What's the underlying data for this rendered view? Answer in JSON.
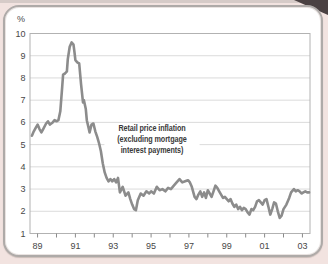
{
  "page": {
    "background_color": "#f2e3e0",
    "card_color": "#ffffff",
    "card_border_color": "#aeaaa8",
    "corner_accent_color": "#4a4142"
  },
  "chart_data": {
    "type": "line",
    "title": "",
    "unit_label": "%",
    "annotation": "Retail price inflation (excluding mortgage interest payments)",
    "annotation_lines": [
      "Retail price inflation",
      "(excluding mortgage",
      "interest payments)"
    ],
    "xlim": [
      1988.6,
      2003.4
    ],
    "ylim": [
      1,
      10
    ],
    "grid": "horizontal",
    "legend": "none",
    "line_color": "#8c8c8c",
    "line_width": 2.6,
    "grid_color": "#d2d2d2",
    "axis_color": "#b2b2b2",
    "tick_color": "#8a8a8a",
    "tick_label_color": "#474747",
    "y_ticks": [
      1,
      2,
      3,
      4,
      5,
      6,
      7,
      8,
      9,
      10
    ],
    "x_ticks": [
      {
        "year": 1989,
        "label": "89"
      },
      {
        "year": 1990,
        "label": ""
      },
      {
        "year": 1991,
        "label": "91"
      },
      {
        "year": 1992,
        "label": ""
      },
      {
        "year": 1993,
        "label": "93"
      },
      {
        "year": 1994,
        "label": ""
      },
      {
        "year": 1995,
        "label": "95"
      },
      {
        "year": 1996,
        "label": ""
      },
      {
        "year": 1997,
        "label": "97"
      },
      {
        "year": 1998,
        "label": ""
      },
      {
        "year": 1999,
        "label": "99"
      },
      {
        "year": 2000,
        "label": ""
      },
      {
        "year": 2001,
        "label": "01"
      },
      {
        "year": 2002,
        "label": ""
      },
      {
        "year": 2003,
        "label": "03"
      }
    ],
    "series": [
      {
        "name": "Retail price inflation (excluding mortgage interest payments)",
        "points": [
          [
            1988.7,
            5.4
          ],
          [
            1988.8,
            5.6
          ],
          [
            1988.9,
            5.75
          ],
          [
            1989.0,
            5.9
          ],
          [
            1989.1,
            5.7
          ],
          [
            1989.2,
            5.55
          ],
          [
            1989.3,
            5.7
          ],
          [
            1989.45,
            5.95
          ],
          [
            1989.55,
            6.05
          ],
          [
            1989.65,
            5.9
          ],
          [
            1989.8,
            6.0
          ],
          [
            1989.9,
            6.1
          ],
          [
            1990.0,
            6.05
          ],
          [
            1990.1,
            6.1
          ],
          [
            1990.2,
            6.5
          ],
          [
            1990.3,
            7.6
          ],
          [
            1990.35,
            8.15
          ],
          [
            1990.45,
            8.2
          ],
          [
            1990.55,
            8.3
          ],
          [
            1990.6,
            8.85
          ],
          [
            1990.7,
            9.4
          ],
          [
            1990.8,
            9.6
          ],
          [
            1990.9,
            9.5
          ],
          [
            1990.95,
            9.15
          ],
          [
            1991.0,
            8.8
          ],
          [
            1991.1,
            8.7
          ],
          [
            1991.2,
            8.65
          ],
          [
            1991.3,
            7.7
          ],
          [
            1991.4,
            6.9
          ],
          [
            1991.45,
            7.0
          ],
          [
            1991.55,
            6.6
          ],
          [
            1991.6,
            6.1
          ],
          [
            1991.7,
            5.75
          ],
          [
            1991.75,
            5.55
          ],
          [
            1991.85,
            5.9
          ],
          [
            1991.95,
            5.95
          ],
          [
            1992.05,
            5.6
          ],
          [
            1992.15,
            5.35
          ],
          [
            1992.25,
            5.05
          ],
          [
            1992.35,
            4.7
          ],
          [
            1992.45,
            4.15
          ],
          [
            1992.55,
            3.75
          ],
          [
            1992.65,
            3.5
          ],
          [
            1992.75,
            3.35
          ],
          [
            1992.85,
            3.45
          ],
          [
            1992.95,
            3.35
          ],
          [
            1993.05,
            3.45
          ],
          [
            1993.15,
            3.3
          ],
          [
            1993.25,
            3.5
          ],
          [
            1993.35,
            2.85
          ],
          [
            1993.5,
            3.1
          ],
          [
            1993.65,
            2.7
          ],
          [
            1993.8,
            2.85
          ],
          [
            1993.9,
            2.55
          ],
          [
            1994.0,
            2.3
          ],
          [
            1994.1,
            2.1
          ],
          [
            1994.2,
            2.05
          ],
          [
            1994.3,
            2.5
          ],
          [
            1994.45,
            2.8
          ],
          [
            1994.6,
            2.7
          ],
          [
            1994.75,
            2.9
          ],
          [
            1994.9,
            2.8
          ],
          [
            1995.0,
            2.9
          ],
          [
            1995.15,
            2.8
          ],
          [
            1995.3,
            3.1
          ],
          [
            1995.45,
            2.95
          ],
          [
            1995.6,
            3.0
          ],
          [
            1995.75,
            2.9
          ],
          [
            1995.9,
            3.05
          ],
          [
            1996.05,
            3.0
          ],
          [
            1996.2,
            3.15
          ],
          [
            1996.35,
            3.3
          ],
          [
            1996.5,
            3.45
          ],
          [
            1996.65,
            3.3
          ],
          [
            1996.8,
            3.35
          ],
          [
            1996.95,
            3.4
          ],
          [
            1997.05,
            3.3
          ],
          [
            1997.15,
            3.1
          ],
          [
            1997.3,
            2.65
          ],
          [
            1997.4,
            2.55
          ],
          [
            1997.5,
            2.75
          ],
          [
            1997.6,
            2.9
          ],
          [
            1997.7,
            2.65
          ],
          [
            1997.8,
            2.85
          ],
          [
            1997.9,
            2.6
          ],
          [
            1998.0,
            2.95
          ],
          [
            1998.1,
            2.8
          ],
          [
            1998.2,
            2.65
          ],
          [
            1998.3,
            2.9
          ],
          [
            1998.4,
            3.15
          ],
          [
            1998.5,
            3.05
          ],
          [
            1998.6,
            2.9
          ],
          [
            1998.7,
            2.75
          ],
          [
            1998.8,
            2.6
          ],
          [
            1998.9,
            2.65
          ],
          [
            1999.0,
            2.55
          ],
          [
            1999.1,
            2.45
          ],
          [
            1999.2,
            2.55
          ],
          [
            1999.3,
            2.35
          ],
          [
            1999.4,
            2.2
          ],
          [
            1999.5,
            2.3
          ],
          [
            1999.6,
            2.1
          ],
          [
            1999.7,
            2.2
          ],
          [
            1999.8,
            2.05
          ],
          [
            1999.9,
            2.15
          ],
          [
            2000.0,
            2.1
          ],
          [
            2000.1,
            1.95
          ],
          [
            2000.2,
            1.85
          ],
          [
            2000.3,
            2.1
          ],
          [
            2000.4,
            2.05
          ],
          [
            2000.5,
            2.2
          ],
          [
            2000.6,
            2.45
          ],
          [
            2000.7,
            2.5
          ],
          [
            2000.8,
            2.4
          ],
          [
            2000.9,
            2.3
          ],
          [
            2001.0,
            2.5
          ],
          [
            2001.1,
            2.55
          ],
          [
            2001.2,
            2.2
          ],
          [
            2001.3,
            1.85
          ],
          [
            2001.4,
            2.1
          ],
          [
            2001.5,
            2.4
          ],
          [
            2001.6,
            2.35
          ],
          [
            2001.7,
            2.0
          ],
          [
            2001.8,
            1.7
          ],
          [
            2001.9,
            1.8
          ],
          [
            2002.0,
            2.1
          ],
          [
            2002.15,
            2.3
          ],
          [
            2002.3,
            2.6
          ],
          [
            2002.4,
            2.85
          ],
          [
            2002.55,
            3.0
          ],
          [
            2002.65,
            2.9
          ],
          [
            2002.75,
            2.95
          ],
          [
            2002.85,
            2.9
          ],
          [
            2002.95,
            2.8
          ],
          [
            2003.05,
            2.85
          ],
          [
            2003.15,
            2.9
          ],
          [
            2003.25,
            2.85
          ],
          [
            2003.35,
            2.85
          ]
        ]
      }
    ]
  }
}
